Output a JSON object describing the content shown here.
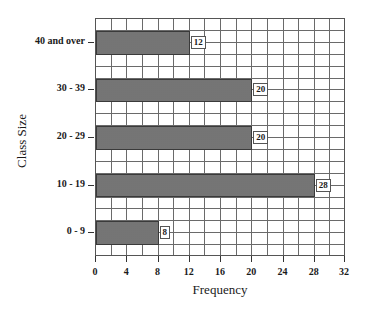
{
  "chart_data": {
    "type": "bar",
    "orientation": "horizontal",
    "title": "",
    "xlabel": "Frequency",
    "ylabel": "Class Size",
    "categories": [
      "40 and over",
      "30 - 39",
      "20 - 29",
      "10 - 19",
      "0 - 9"
    ],
    "values": [
      12,
      20,
      20,
      28,
      8
    ],
    "data_labels": [
      "12",
      "20",
      "20",
      "28",
      "8"
    ],
    "xlim": [
      0,
      32
    ],
    "x_ticks": [
      "0",
      "4",
      "8",
      "12",
      "16",
      "20",
      "24",
      "28",
      "32"
    ],
    "grid": true,
    "legend": null
  },
  "colors": {
    "bar_fill": "#8a8a8a",
    "grid": "#6a6a6a",
    "text": "#1a1a1a"
  }
}
